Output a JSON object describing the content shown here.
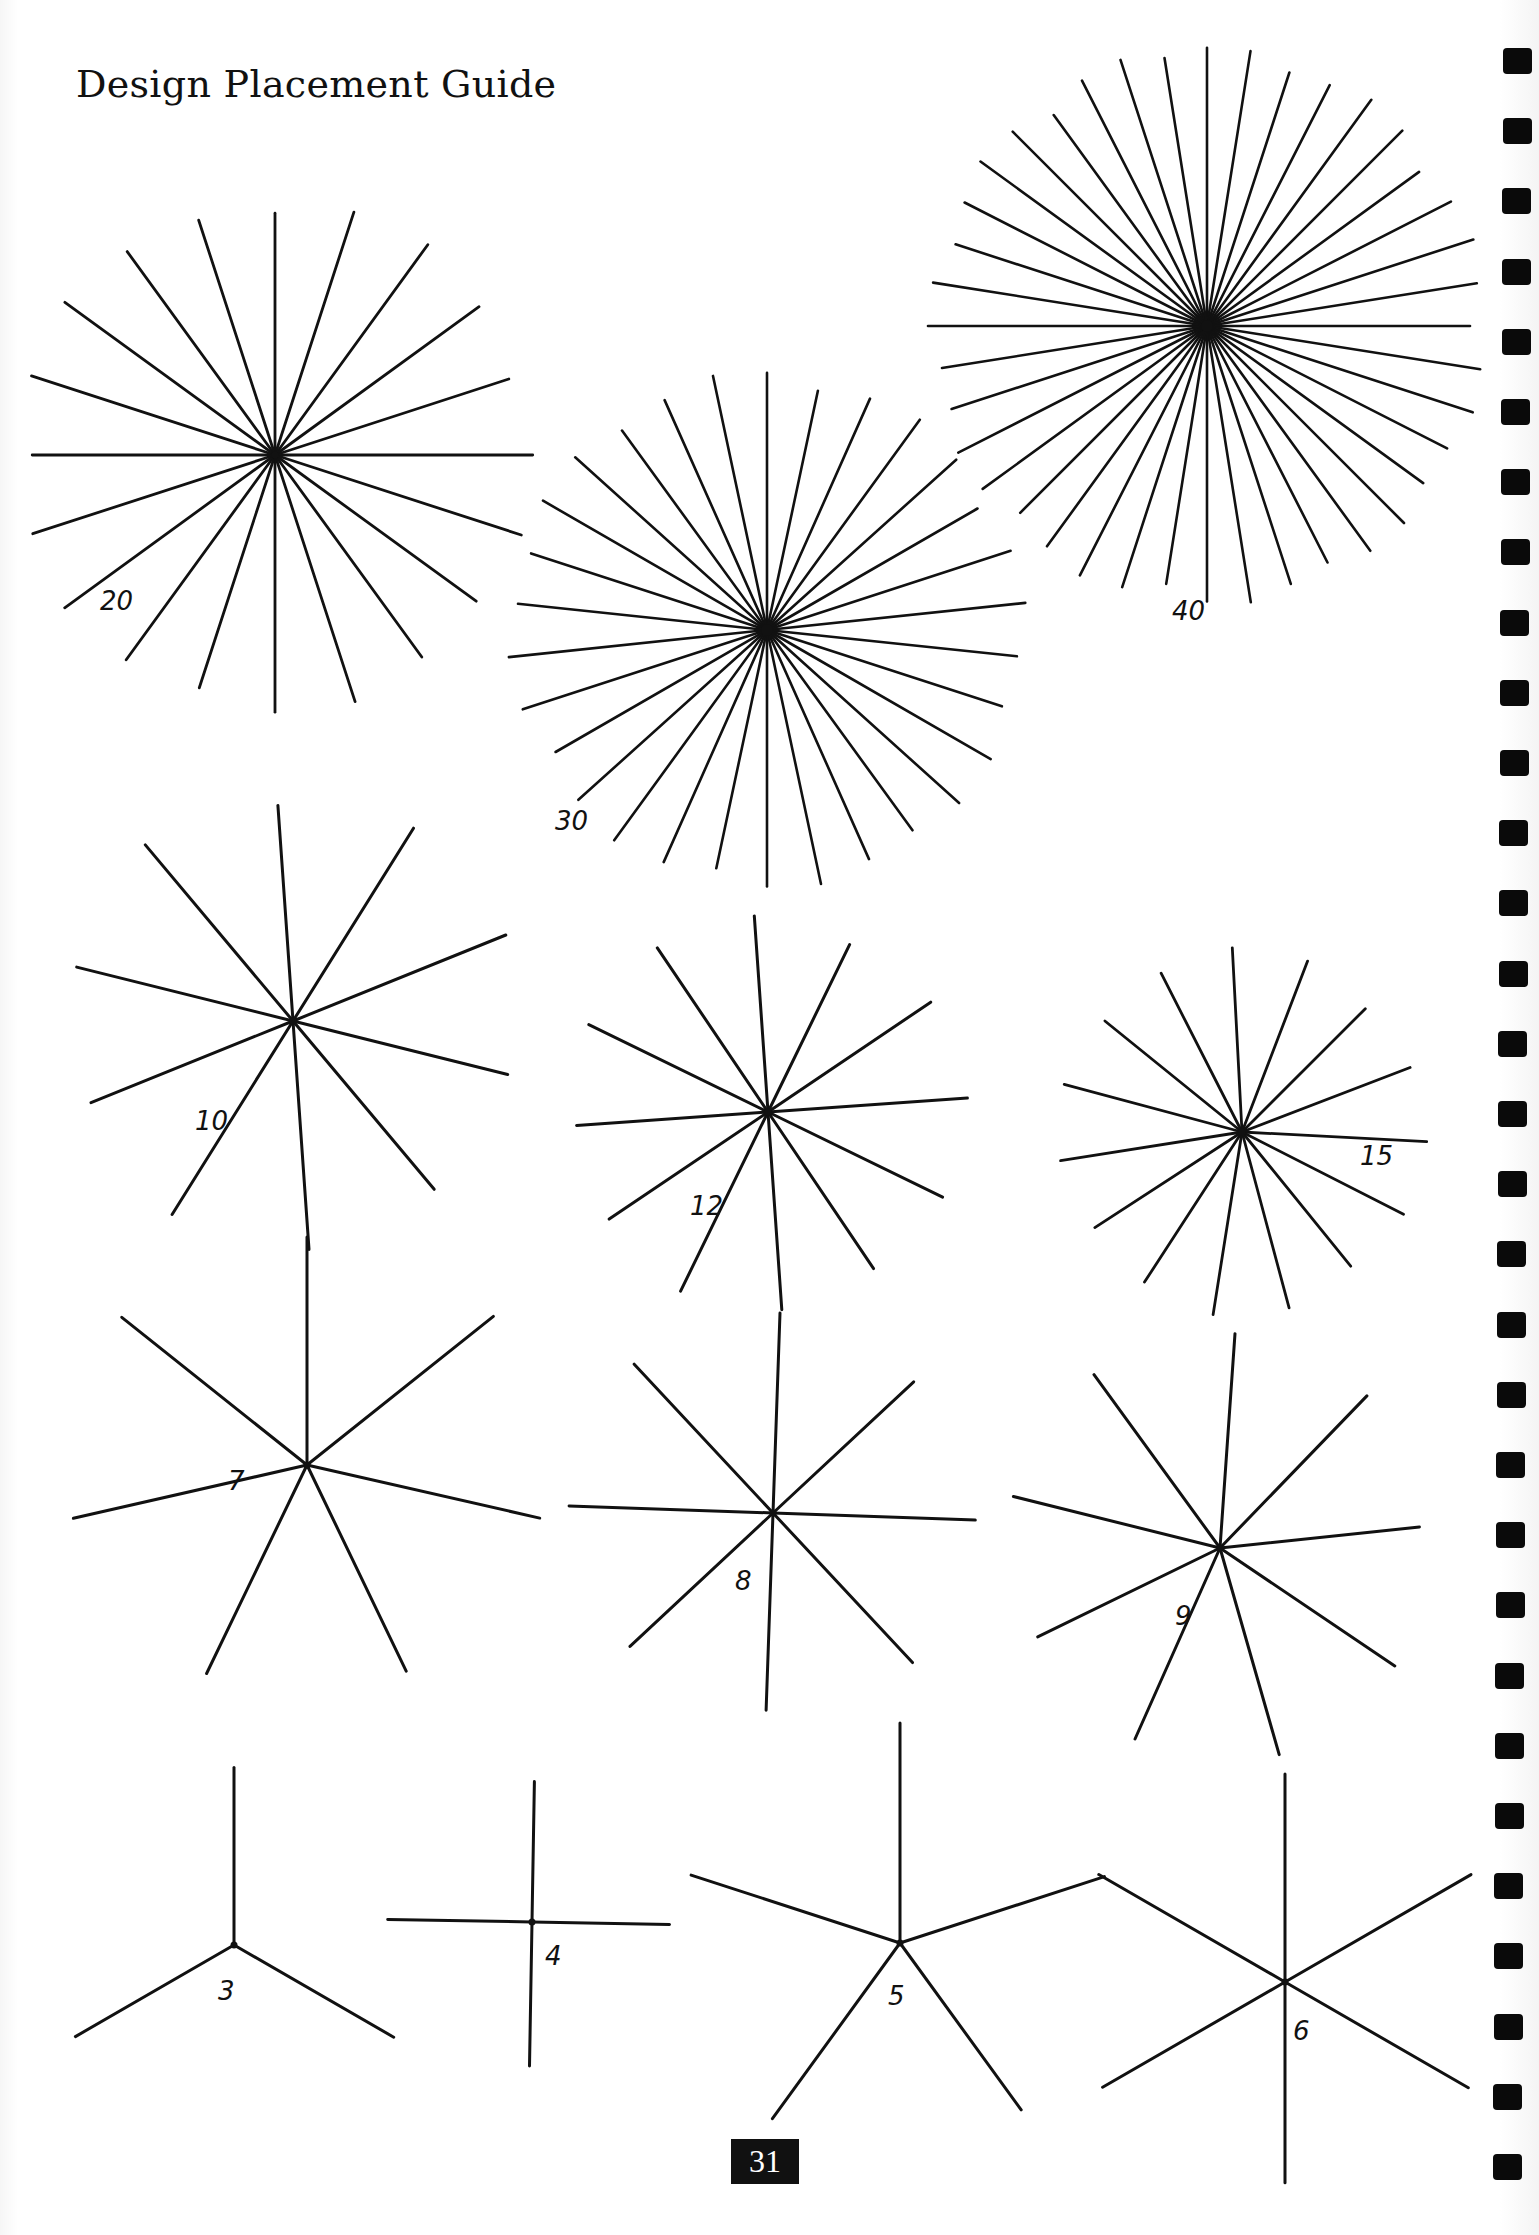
{
  "page": {
    "title": "Design Placement Guide",
    "page_number": "31",
    "ink_color": "#111111"
  },
  "stars": [
    {
      "label": "20",
      "rays": 20,
      "cx": 275,
      "cy": 455,
      "r": 260,
      "rotation": 0,
      "label_x": 100,
      "label_y": 610
    },
    {
      "label": "30",
      "rays": 30,
      "cx": 767,
      "cy": 630,
      "r": 260,
      "rotation": 0,
      "label_x": 555,
      "label_y": 830
    },
    {
      "label": "40",
      "rays": 40,
      "cx": 1207,
      "cy": 326,
      "r": 280,
      "rotation": 0,
      "label_x": 1172,
      "label_y": 620
    },
    {
      "label": "10",
      "rays": 10,
      "cx": 293,
      "cy": 1021,
      "r": 230,
      "rotation": -4,
      "label_x": 195,
      "label_y": 1130
    },
    {
      "label": "12",
      "rays": 12,
      "cx": 768,
      "cy": 1112,
      "r": 200,
      "rotation": -4,
      "label_x": 690,
      "label_y": 1215
    },
    {
      "label": "15",
      "rays": 15,
      "cx": 1242,
      "cy": 1132,
      "r": 185,
      "rotation": -3,
      "label_x": 1360,
      "label_y": 1165
    },
    {
      "label": "7",
      "rays": 7,
      "cx": 307,
      "cy": 1465,
      "r": 240,
      "rotation": 0,
      "label_x": 228,
      "label_y": 1490
    },
    {
      "label": "8",
      "rays": 8,
      "cx": 773,
      "cy": 1513,
      "r": 205,
      "rotation": 2,
      "label_x": 735,
      "label_y": 1590
    },
    {
      "label": "9",
      "rays": 9,
      "cx": 1220,
      "cy": 1548,
      "r": 215,
      "rotation": 4,
      "label_x": 1175,
      "label_y": 1625
    },
    {
      "label": "3",
      "rays": 3,
      "cx": 234,
      "cy": 1945,
      "r": 185,
      "rotation": 0,
      "label_x": 218,
      "label_y": 2000
    },
    {
      "label": "4",
      "rays": 4,
      "cx": 532,
      "cy": 1922,
      "r": 145,
      "rotation": 1,
      "label_x": 545,
      "label_y": 1965
    },
    {
      "label": "5",
      "rays": 5,
      "cx": 900,
      "cy": 1943,
      "r": 220,
      "rotation": 0,
      "label_x": 888,
      "label_y": 2005
    },
    {
      "label": "6",
      "rays": 6,
      "cx": 1285,
      "cy": 1982,
      "r": 215,
      "rotation": 0,
      "label_x": 1293,
      "label_y": 2040
    }
  ],
  "binding": {
    "hole_count": 31,
    "first_hole_y": 48,
    "hole_spacing": 70.2,
    "x_start": 1503,
    "x_end": 1493
  }
}
